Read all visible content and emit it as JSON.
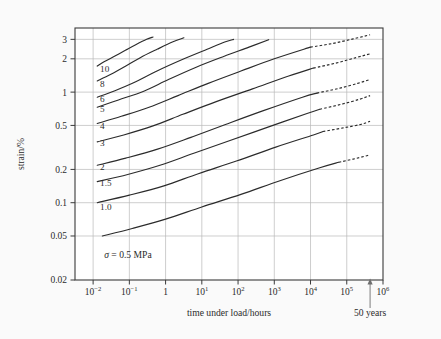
{
  "figure": {
    "background_color": "#fafafa",
    "plot_background_color": "#ffffff",
    "axis_color": "#3a3a3a",
    "grid_color": "#b9b9b9",
    "curve_color": "#2b2b2b"
  },
  "chart_data": {
    "type": "line",
    "title": "",
    "subtitle": "",
    "xlabel": "time under load/hours",
    "ylabel": "strain/%",
    "xscale": "log",
    "yscale": "log",
    "xlim": [
      0.003162,
      1000000
    ],
    "ylim": [
      0.02,
      3.8
    ],
    "grid": true,
    "legend_position": "inline-left-labels",
    "x_tick_labels": [
      "10−2",
      "10−1",
      "1",
      "10",
      "10²",
      "10³",
      "10⁴",
      "10⁵",
      "10⁶"
    ],
    "x_tick_bases": [
      "10",
      "10",
      "1",
      "10",
      "10",
      "10",
      "10",
      "10",
      "10"
    ],
    "x_tick_exponents": [
      "-2",
      "-1",
      "",
      "1",
      "2",
      "3",
      "4",
      "5",
      "6"
    ],
    "x_tick_values": [
      0.01,
      0.1,
      1,
      10,
      100,
      1000,
      10000,
      100000,
      1000000
    ],
    "y_tick_labels": [
      "3",
      "2",
      "1",
      "0.5",
      "0.2",
      "0.1",
      "0.05",
      "0.02"
    ],
    "y_tick_values": [
      3,
      2,
      1,
      0.5,
      0.2,
      0.1,
      0.05,
      0.02
    ],
    "series_legend_title": "stress σ / MPa",
    "series": [
      {
        "name": "10",
        "label": "10",
        "stress_MPa": 10,
        "label_at": {
          "x": 0.01,
          "y": 1.62
        },
        "solid_x": [
          0.013,
          0.02,
          0.04,
          0.08,
          0.15,
          0.3,
          0.45
        ],
        "solid_y": [
          1.72,
          1.88,
          2.12,
          2.4,
          2.68,
          3.0,
          3.15
        ],
        "dashed_x": [],
        "dashed_y": []
      },
      {
        "name": "8",
        "label": "8",
        "stress_MPa": 8,
        "label_at": {
          "x": 0.01,
          "y": 1.2
        },
        "solid_x": [
          0.013,
          0.03,
          0.08,
          0.2,
          0.6,
          1.6,
          3.2
        ],
        "solid_y": [
          1.26,
          1.44,
          1.72,
          2.05,
          2.45,
          2.85,
          3.1
        ],
        "dashed_x": [],
        "dashed_y": []
      },
      {
        "name": "6",
        "label": "6",
        "stress_MPa": 6,
        "label_at": {
          "x": 0.01,
          "y": 0.87
        },
        "solid_x": [
          0.013,
          0.04,
          0.15,
          0.6,
          3.0,
          14,
          45,
          75
        ],
        "solid_y": [
          0.9,
          1.03,
          1.24,
          1.56,
          1.98,
          2.44,
          2.85,
          3.0
        ],
        "dashed_x": [],
        "dashed_y": []
      },
      {
        "name": "5",
        "label": "5",
        "stress_MPa": 5,
        "label_at": {
          "x": 0.01,
          "y": 0.7
        },
        "solid_x": [
          0.013,
          0.05,
          0.25,
          1.2,
          7,
          40,
          200,
          700
        ],
        "solid_y": [
          0.73,
          0.85,
          1.02,
          1.3,
          1.68,
          2.1,
          2.55,
          2.98
        ],
        "dashed_x": [],
        "dashed_y": []
      },
      {
        "name": "4",
        "label": "4",
        "stress_MPa": 4,
        "label_at": {
          "x": 0.01,
          "y": 0.5
        },
        "solid_x": [
          0.013,
          0.06,
          0.35,
          2.2,
          15,
          120,
          1000,
          10000
        ],
        "solid_y": [
          0.52,
          0.605,
          0.73,
          0.93,
          1.2,
          1.55,
          2.0,
          2.55
        ],
        "dashed_x": [
          10000,
          40000,
          150000,
          440000
        ],
        "dashed_y": [
          2.55,
          2.75,
          3.03,
          3.3
        ]
      },
      {
        "name": "3",
        "label": "3",
        "stress_MPa": 3,
        "label_at": {
          "x": 0.01,
          "y": 0.35
        },
        "solid_x": [
          0.013,
          0.07,
          0.45,
          3.0,
          25,
          250,
          2500,
          12000
        ],
        "solid_y": [
          0.355,
          0.41,
          0.495,
          0.63,
          0.82,
          1.07,
          1.4,
          1.65
        ],
        "dashed_x": [
          12000,
          50000,
          180000,
          440000
        ],
        "dashed_y": [
          1.65,
          1.83,
          2.05,
          2.22
        ]
      },
      {
        "name": "2",
        "label": "2",
        "stress_MPa": 2,
        "label_at": {
          "x": 0.01,
          "y": 0.213
        },
        "solid_x": [
          0.013,
          0.08,
          0.6,
          5.0,
          45,
          500,
          6000,
          15000
        ],
        "solid_y": [
          0.218,
          0.253,
          0.305,
          0.39,
          0.51,
          0.68,
          0.9,
          0.98
        ],
        "dashed_x": [
          15000,
          60000,
          200000,
          440000
        ],
        "dashed_y": [
          0.98,
          1.08,
          1.2,
          1.3
        ]
      },
      {
        "name": "1.5",
        "label": "1.5",
        "stress_MPa": 1.5,
        "label_at": {
          "x": 0.01,
          "y": 0.152
        },
        "solid_x": [
          0.013,
          0.09,
          0.7,
          6.0,
          60,
          700,
          8000,
          18000
        ],
        "solid_y": [
          0.155,
          0.18,
          0.218,
          0.28,
          0.365,
          0.485,
          0.64,
          0.7
        ],
        "dashed_x": [
          18000,
          70000,
          220000,
          440000
        ],
        "dashed_y": [
          0.7,
          0.775,
          0.86,
          0.93
        ]
      },
      {
        "name": "1.0",
        "label": "1.0",
        "stress_MPa": 1.0,
        "label_at": {
          "x": 0.01,
          "y": 0.092
        },
        "solid_x": [
          0.013,
          0.1,
          0.9,
          8.0,
          90,
          1100,
          12000,
          22000
        ],
        "solid_y": [
          0.1,
          0.117,
          0.142,
          0.183,
          0.238,
          0.318,
          0.41,
          0.44
        ],
        "dashed_x": [
          22000,
          80000,
          240000,
          440000
        ],
        "dashed_y": [
          0.44,
          0.475,
          0.51,
          0.545
        ],
        "note": "lowest solid trace at 0.1% at 10^-2 h"
      },
      {
        "name": "0.5",
        "label": "σ = 0.5 MPa",
        "stress_MPa": 0.5,
        "label_at": {
          "x": 0.012,
          "y": 0.033
        },
        "solid_x": [
          0.018,
          0.12,
          1.0,
          10,
          120,
          1500,
          18000,
          60000
        ],
        "solid_y": [
          0.05,
          0.0585,
          0.071,
          0.0915,
          0.119,
          0.159,
          0.207,
          0.232
        ],
        "dashed_x": [
          60000,
          150000,
          300000,
          440000
        ],
        "dashed_y": [
          0.232,
          0.248,
          0.262,
          0.272
        ]
      }
    ],
    "annotations": [
      {
        "name": "stress-annotation",
        "text": "σ = 0.5 MPa",
        "x": 0.013,
        "y": 0.0335
      },
      {
        "name": "fifty-years-marker",
        "text": "50 years",
        "x": 440000,
        "y": 0.02,
        "arrow": "up"
      }
    ]
  },
  "axis_titles": {
    "x": "time under load/hours",
    "y": "strain/%"
  },
  "marker": {
    "fifty_years_label": "50 years"
  }
}
